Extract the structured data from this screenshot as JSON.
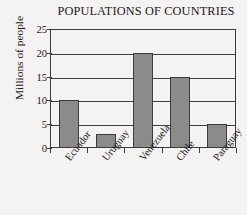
{
  "chart_data": {
    "type": "bar",
    "title": "POPULATIONS OF COUNTRIES",
    "xlabel": "",
    "ylabel": "Millions of people",
    "categories": [
      "Ecuador",
      "Uruguay",
      "Venezuela",
      "Chile",
      "Paraguay"
    ],
    "values": [
      10,
      3,
      20,
      15,
      5
    ],
    "ylim": [
      0,
      25
    ],
    "yticks": [
      0,
      5,
      10,
      15,
      20,
      25
    ],
    "ytick_labels": [
      "0",
      "5",
      "10",
      "15",
      "20",
      "25"
    ],
    "grid": "horizontal",
    "legend": "none",
    "bar_color": "#8b8b8b",
    "bar_edge_color": "#3c3c3e",
    "axis_color": "#3f3f41",
    "text_color": "#17181a",
    "background_color": "#f4f3f1"
  }
}
